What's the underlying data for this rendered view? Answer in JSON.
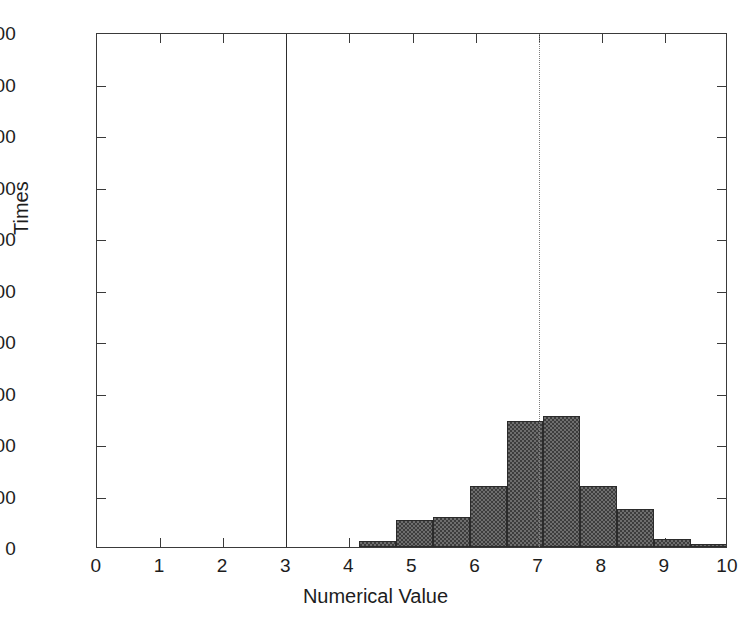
{
  "chart_data": {
    "type": "bar",
    "title": "",
    "xlabel": "Numerical Value",
    "ylabel": "Times",
    "xlim": [
      0,
      10
    ],
    "ylim": [
      0,
      1000
    ],
    "xticks": [
      "0",
      "1",
      "2",
      "3",
      "4",
      "5",
      "6",
      "7",
      "8",
      "9",
      "10"
    ],
    "yticks": [
      "0",
      "100",
      "200",
      "300",
      "400",
      "500",
      "600",
      "700",
      "800",
      "900",
      "1000"
    ],
    "grid": false,
    "legend": null,
    "bin_width": 0.585,
    "bars": [
      {
        "x_left": 4.15,
        "x_right": 4.735,
        "value": 12
      },
      {
        "x_left": 4.735,
        "x_right": 5.32,
        "value": 52
      },
      {
        "x_left": 5.32,
        "x_right": 5.905,
        "value": 58
      },
      {
        "x_left": 5.905,
        "x_right": 6.49,
        "value": 118
      },
      {
        "x_left": 6.49,
        "x_right": 7.075,
        "value": 245
      },
      {
        "x_left": 7.075,
        "x_right": 7.66,
        "value": 255
      },
      {
        "x_left": 7.66,
        "x_right": 8.245,
        "value": 119
      },
      {
        "x_left": 8.245,
        "x_right": 8.83,
        "value": 74
      },
      {
        "x_left": 8.83,
        "x_right": 9.415,
        "value": 15
      },
      {
        "x_left": 9.415,
        "x_right": 10.0,
        "value": 6
      }
    ],
    "reference_lines": [
      {
        "name": "threshold-line",
        "x": 3.0,
        "style": "solid",
        "color": "#2d2d2d"
      },
      {
        "name": "mean-line",
        "x": 7.0,
        "style": "dotted",
        "color": "#7d7d7d"
      }
    ]
  },
  "colors": {
    "bar_fill": "#6e6e6e",
    "bar_edge": "#2b2b2b",
    "axis": "#3a3a3a",
    "text": "#1d1d1d",
    "background": "#ffffff"
  }
}
